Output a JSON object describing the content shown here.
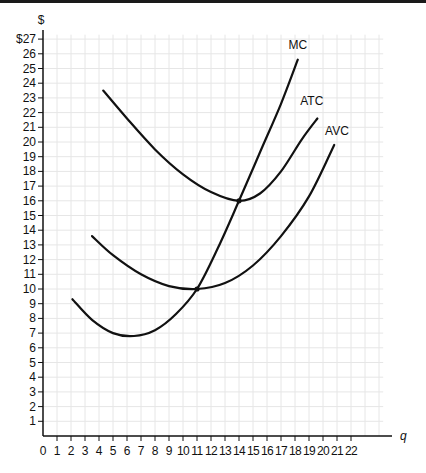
{
  "chart_data": {
    "type": "line",
    "title": "",
    "xlabel": "q",
    "ylabel": "$",
    "xlim": [
      0,
      23
    ],
    "ylim": [
      0,
      27
    ],
    "grid": true,
    "legend": "inline labels at curve ends",
    "x_ticks": [
      "0",
      "1",
      "2",
      "3",
      "4",
      "5",
      "6",
      "7",
      "8",
      "9",
      "10",
      "11",
      "12",
      "13",
      "14",
      "15",
      "16",
      "17",
      "18",
      "19",
      "20",
      "21",
      "22"
    ],
    "y_ticks": [
      "1",
      "2",
      "3",
      "4",
      "5",
      "6",
      "7",
      "8",
      "9",
      "10",
      "11",
      "12",
      "13",
      "14",
      "15",
      "16",
      "17",
      "18",
      "19",
      "20",
      "21",
      "22",
      "23",
      "24",
      "25",
      "26",
      "$27"
    ],
    "series": [
      {
        "name": "MC",
        "points": [
          [
            2.1,
            9.3
          ],
          [
            3.5,
            7.9
          ],
          [
            5,
            7.0
          ],
          [
            6.5,
            6.8
          ],
          [
            8,
            7.2
          ],
          [
            9.5,
            8.3
          ],
          [
            11,
            10
          ],
          [
            12.5,
            12.8
          ],
          [
            14,
            16
          ],
          [
            15.5,
            19.3
          ],
          [
            17,
            22.6
          ],
          [
            18.2,
            25.6
          ]
        ]
      },
      {
        "name": "ATC",
        "points": [
          [
            4.3,
            23.5
          ],
          [
            6,
            21.6
          ],
          [
            8,
            19.5
          ],
          [
            10,
            17.8
          ],
          [
            12,
            16.6
          ],
          [
            14,
            16
          ],
          [
            15.5,
            16.5
          ],
          [
            17,
            18.0
          ],
          [
            18.5,
            20.2
          ],
          [
            19.6,
            21.6
          ]
        ]
      },
      {
        "name": "AVC",
        "points": [
          [
            3.5,
            13.6
          ],
          [
            5,
            12.3
          ],
          [
            7,
            11.0
          ],
          [
            9,
            10.2
          ],
          [
            11,
            10
          ],
          [
            13,
            10.4
          ],
          [
            15,
            11.6
          ],
          [
            17,
            13.6
          ],
          [
            19,
            16.3
          ],
          [
            20.8,
            19.8
          ]
        ]
      }
    ],
    "annotations": [
      {
        "text": "MC",
        "x": 18.2,
        "y": 26.3
      },
      {
        "text": "ATC",
        "x": 19.2,
        "y": 22.5
      },
      {
        "text": "AVC",
        "x": 21.0,
        "y": 20.5
      }
    ]
  }
}
